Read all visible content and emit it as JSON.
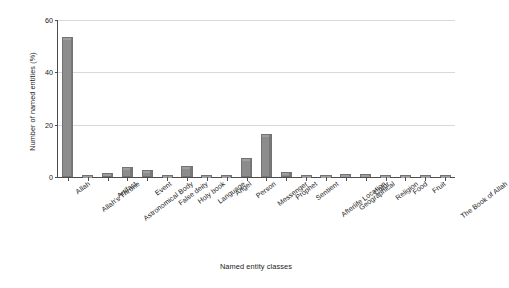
{
  "chart_data": {
    "type": "bar",
    "title": "",
    "xlabel": "Named entity classes",
    "ylabel": "Number of named entities (%)",
    "ylim": [
      0,
      60
    ],
    "yticks": [
      0,
      20,
      40,
      60
    ],
    "grid": true,
    "legend": "none",
    "bar_color": "#8c8c8c",
    "categories": [
      "Allah",
      "Allah's Throne",
      "Artifact",
      "Astronomical Body",
      "Event",
      "False deity",
      "Holy book",
      "Language",
      "Angel",
      "Person",
      "Messenger",
      "Prophet",
      "Sentient",
      "Afterlife Location",
      "Geographical",
      "Color",
      "Religion",
      "Food",
      "Fruit",
      "The Book of Allah"
    ],
    "values": [
      53.5,
      0.4,
      1.6,
      4.0,
      2.6,
      0.4,
      4.3,
      0.3,
      0.9,
      7.2,
      16.3,
      1.9,
      0.3,
      0.3,
      1.0,
      1.0,
      0.4,
      0.6,
      0.5,
      0.4
    ]
  }
}
